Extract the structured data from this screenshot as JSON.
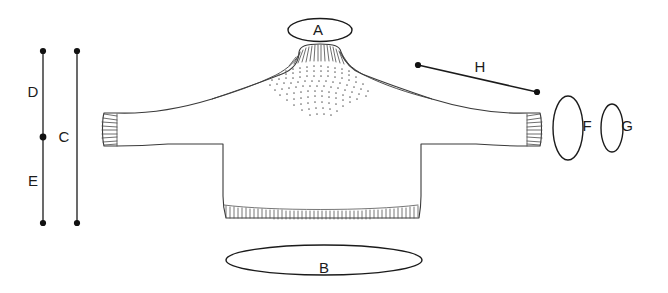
{
  "diagram": {
    "background_color": "#ffffff",
    "garment_outline_color": "#3a3a3a",
    "measurement_color": "#1b1b1b",
    "yoke_pattern_color": "#6b6b6b"
  },
  "measurements": [
    {
      "key": "A",
      "label": "A",
      "kind": "ellipse",
      "name": "neck-opening",
      "cx": 320,
      "cy": 30,
      "rx": 32,
      "ry": 11.5,
      "label_x": 318,
      "label_y": 31
    },
    {
      "key": "B",
      "label": "B",
      "kind": "ellipse",
      "name": "hem-circumference",
      "cx": 324,
      "cy": 260,
      "rx": 98,
      "ry": 15,
      "label_x": 324,
      "label_y": 269
    },
    {
      "key": "C",
      "label": "C",
      "kind": "vertical-line",
      "name": "total-length",
      "x": 77,
      "y1": 51,
      "y2": 223,
      "label_x": 64,
      "label_y": 138
    },
    {
      "key": "D",
      "label": "D",
      "kind": "vertical-line-segment",
      "name": "upper-length",
      "x": 43,
      "y1": 51,
      "y2": 137,
      "label_x": 33,
      "label_y": 93
    },
    {
      "key": "E",
      "label": "E",
      "kind": "vertical-line-segment",
      "name": "lower-length",
      "x": 43,
      "y1": 137,
      "y2": 223,
      "label_x": 33,
      "label_y": 182
    },
    {
      "key": "F",
      "label": "F",
      "kind": "ellipse",
      "name": "upper-sleeve-circumference",
      "cx": 568,
      "cy": 128,
      "rx": 15,
      "ry": 32,
      "label_x": 587,
      "label_y": 127
    },
    {
      "key": "G",
      "label": "G",
      "kind": "ellipse",
      "name": "cuff-circumference",
      "cx": 612,
      "cy": 128,
      "rx": 11,
      "ry": 24,
      "label_x": 627,
      "label_y": 127
    },
    {
      "key": "H",
      "label": "H",
      "kind": "diagonal-line",
      "name": "sleeve-length",
      "x1": 418,
      "y1": 65,
      "x2": 537,
      "y2": 92,
      "label_x": 480,
      "label_y": 68
    }
  ]
}
